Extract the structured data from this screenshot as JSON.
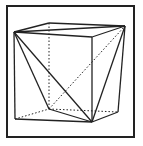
{
  "figure": {
    "stroke_color": "#222222",
    "background": "#ffffff",
    "frame": {
      "x": 7,
      "y": 6,
      "width": 127,
      "height": 131
    },
    "vertices": {
      "A": [
        14,
        32
      ],
      "B": [
        49,
        23
      ],
      "C": [
        125,
        26
      ],
      "D": [
        92,
        37
      ],
      "E": [
        15,
        119
      ],
      "F": [
        49,
        109
      ],
      "G": [
        92,
        122
      ],
      "H": [
        118,
        112
      ]
    },
    "solid_edges": [
      [
        "A",
        "B"
      ],
      [
        "B",
        "C"
      ],
      [
        "C",
        "D"
      ],
      [
        "D",
        "A"
      ],
      [
        "A",
        "C"
      ],
      [
        "A",
        "E"
      ],
      [
        "D",
        "G"
      ],
      [
        "E",
        "G"
      ],
      [
        "A",
        "F"
      ],
      [
        "A",
        "G"
      ],
      [
        "F",
        "G"
      ],
      [
        "C",
        "G"
      ],
      [
        "C",
        "H"
      ],
      [
        "H",
        "G"
      ]
    ],
    "dashed_edges": [
      [
        "B",
        "F"
      ],
      [
        "E",
        "F"
      ],
      [
        "F",
        "H"
      ],
      [
        "F",
        "C"
      ]
    ]
  }
}
